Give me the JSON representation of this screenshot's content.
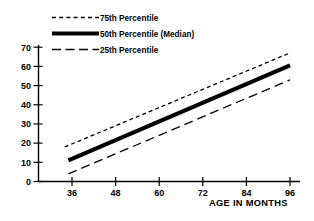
{
  "chart_data": {
    "type": "line",
    "title": "",
    "xlabel": "AGE IN MONTHS",
    "ylabel": "",
    "xlim": [
      32,
      98
    ],
    "ylim": [
      0,
      73
    ],
    "xticks": [
      36,
      48,
      60,
      72,
      84,
      96
    ],
    "yticks": [
      0,
      10,
      20,
      30,
      40,
      50,
      60,
      70
    ],
    "xtick_labels": [
      "36",
      "48",
      "60",
      "72",
      "84",
      "96"
    ],
    "ytick_labels": [
      "0",
      "10",
      "20",
      "30",
      "40",
      "50",
      "60",
      "70"
    ],
    "grid": false,
    "legend_position": "top-left",
    "series": [
      {
        "name": "75th Percentile",
        "style": "dashed",
        "linewidth": 1.3,
        "x": [
          34,
          96
        ],
        "values": [
          18,
          67
        ]
      },
      {
        "name": "50th Percentile (Median)",
        "style": "solid-thick",
        "linewidth": 4.2,
        "x": [
          35,
          96
        ],
        "values": [
          11,
          60.5
        ]
      },
      {
        "name": "25th Percentile",
        "style": "long-dashed",
        "linewidth": 1.3,
        "x": [
          35,
          96
        ],
        "values": [
          4,
          53
        ]
      }
    ]
  },
  "legend": {
    "entries": [
      {
        "label": "75th Percentile",
        "swatch": "dashed-line-icon"
      },
      {
        "label": "50th Percentile (Median)",
        "swatch": "thick-solid-line-icon"
      },
      {
        "label": "25th Percentile",
        "swatch": "long-dashed-line-icon"
      }
    ]
  },
  "axes": {
    "x_title": "AGE IN MONTHS"
  }
}
